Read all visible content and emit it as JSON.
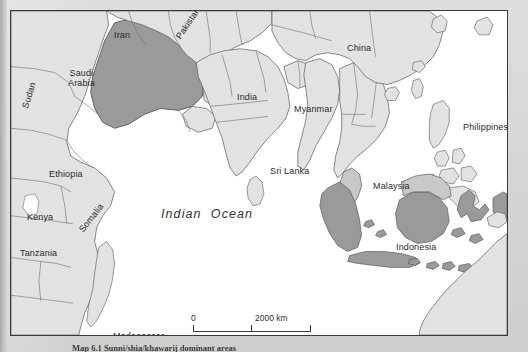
{
  "figure": {
    "caption": "Map 6.1  Sunni/shia/khawarij dominant areas"
  },
  "map": {
    "ocean_label": "Indian  Ocean",
    "scale": {
      "zero_label": "0",
      "max_label": "2000 km",
      "midpoint_label": ""
    },
    "colors": {
      "highlight_fill": "#9a9a9a",
      "secondary_fill": "#c8c8c8",
      "land_fill": "#e2e2e2",
      "ocean_fill": "#ffffff",
      "border_stroke": "#4a4a4a",
      "frame_stroke": "#3a3a3a",
      "page_background": "#d6d6d4"
    },
    "labels": [
      {
        "name": "iran",
        "text": "Iran",
        "x": 103,
        "y": 19,
        "rotate": 0,
        "lines": 1
      },
      {
        "name": "pakistan",
        "text": "Pakistan",
        "x": 167,
        "y": 22,
        "rotate": -56,
        "lines": 1
      },
      {
        "name": "china",
        "text": "China",
        "x": 336,
        "y": 32,
        "rotate": 0,
        "lines": 1
      },
      {
        "name": "india",
        "text": "India",
        "x": 226,
        "y": 81,
        "rotate": 0,
        "lines": 1
      },
      {
        "name": "saudi-arabia",
        "text": "Saudi\nArabia",
        "x": 57,
        "y": 57,
        "rotate": 0,
        "lines": 2
      },
      {
        "name": "sudan",
        "text": "Sudan",
        "x": 14,
        "y": 92,
        "rotate": -73,
        "lines": 1
      },
      {
        "name": "myanmar",
        "text": "Myanmar",
        "x": 283,
        "y": 93,
        "rotate": 0,
        "lines": 1
      },
      {
        "name": "philippines",
        "text": "Philippines",
        "x": 452,
        "y": 111,
        "rotate": 0,
        "lines": 1
      },
      {
        "name": "ethiopia",
        "text": "Ethiopia",
        "x": 38,
        "y": 158,
        "rotate": 0,
        "lines": 1
      },
      {
        "name": "sri-lanka",
        "text": "Sri Lanka",
        "x": 259,
        "y": 155,
        "rotate": 0,
        "lines": 1
      },
      {
        "name": "malaysia",
        "text": "Malaysia",
        "x": 362,
        "y": 170,
        "rotate": 0,
        "lines": 1
      },
      {
        "name": "somalia",
        "text": "Somalia",
        "x": 70,
        "y": 215,
        "rotate": -52,
        "lines": 1
      },
      {
        "name": "kenya",
        "text": "Kenya",
        "x": 16,
        "y": 201,
        "rotate": 0,
        "lines": 1
      },
      {
        "name": "tanzania",
        "text": "Tanzania",
        "x": 9,
        "y": 237,
        "rotate": 0,
        "lines": 1
      },
      {
        "name": "indonesia",
        "text": "Indonesia",
        "x": 385,
        "y": 231,
        "rotate": 0,
        "lines": 1
      },
      {
        "name": "madagascar",
        "text": "Madagascar",
        "x": 102,
        "y": 320,
        "rotate": 0,
        "lines": 1
      },
      {
        "name": "australia",
        "text": "Australia",
        "x": 455,
        "y": 325,
        "rotate": 0,
        "lines": 1
      }
    ]
  },
  "chart_data": {
    "type": "map",
    "highlighted_countries": [
      "Saudi Arabia",
      "Indonesia"
    ],
    "secondary_countries": [
      "Malaysia"
    ],
    "labeled_countries": [
      "Iran",
      "Pakistan",
      "China",
      "India",
      "Saudi Arabia",
      "Sudan",
      "Myanmar",
      "Philippines",
      "Ethiopia",
      "Sri Lanka",
      "Malaysia",
      "Somalia",
      "Kenya",
      "Tanzania",
      "Indonesia",
      "Madagascar",
      "Australia"
    ],
    "water_bodies": [
      "Indian Ocean"
    ],
    "scale_bar_km": 2000,
    "projection_hint": "equirectangular"
  }
}
